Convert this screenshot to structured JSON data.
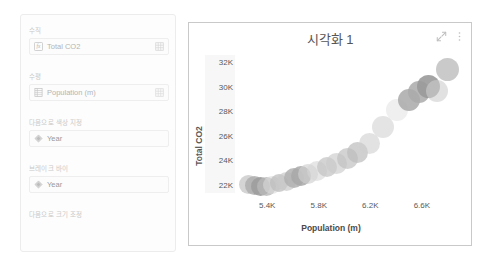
{
  "panel": {
    "wells": [
      {
        "label": "수직",
        "field": "Total CO2",
        "left_icon": "measure-fx-icon",
        "right_icon": "table-grid-icon",
        "has_right_icon": true
      },
      {
        "label": "수평",
        "field": "Population (m)",
        "left_icon": "column-table-icon",
        "right_icon": "table-grid-icon",
        "has_right_icon": true
      },
      {
        "label": "다음으로 색상 지정",
        "field": "Year",
        "left_icon": "diamond-icon",
        "right_icon": "",
        "has_right_icon": false
      },
      {
        "label": "브레이크 바이",
        "field": "Year",
        "left_icon": "diamond-icon",
        "right_icon": "",
        "has_right_icon": false
      },
      {
        "label": "다음으로 크기 조정",
        "field": "",
        "left_icon": "",
        "right_icon": "",
        "has_right_icon": false
      }
    ]
  },
  "chart_card": {
    "title": "시각화 1",
    "expand_icon": "focus-mode-expand-icon",
    "menu_icon": "more-options-vertical-dots-icon"
  },
  "chart_data": {
    "type": "scatter",
    "title": "시각화 1",
    "xlabel": "Population (m)",
    "ylabel": "Total CO2",
    "xlim": [
      5150,
      6950
    ],
    "ylim": [
      21000,
      32600
    ],
    "xticks": [
      "5.4K",
      "5.8K",
      "6.2K",
      "6.6K"
    ],
    "xtick_values": [
      5400,
      5800,
      6200,
      6600
    ],
    "yticks": [
      "22K",
      "24K",
      "26K",
      "28K",
      "30K",
      "32K"
    ],
    "ytick_values": [
      22000,
      24000,
      26000,
      28000,
      30000,
      32000
    ],
    "grid": false,
    "legend": "none",
    "color_by": "Year",
    "points": [
      {
        "x": 5255,
        "y": 22050,
        "r": 9.5,
        "shade": "#c6c6c6",
        "alpha": 0.75
      },
      {
        "x": 5300,
        "y": 21900,
        "r": 9.5,
        "shade": "#aeaeae",
        "alpha": 0.85
      },
      {
        "x": 5350,
        "y": 21820,
        "r": 9.5,
        "shade": "#9d9d9d",
        "alpha": 0.9
      },
      {
        "x": 5398,
        "y": 21860,
        "r": 9.5,
        "shade": "#b8b8b8",
        "alpha": 0.8
      },
      {
        "x": 5440,
        "y": 21980,
        "r": 9.0,
        "shade": "#d8d8d8",
        "alpha": 0.6
      },
      {
        "x": 5495,
        "y": 22180,
        "r": 9.0,
        "shade": "#bdbdbd",
        "alpha": 0.75
      },
      {
        "x": 5548,
        "y": 22260,
        "r": 9.5,
        "shade": "#c9c9c9",
        "alpha": 0.7
      },
      {
        "x": 5605,
        "y": 22520,
        "r": 10.0,
        "shade": "#b0b0b0",
        "alpha": 0.85
      },
      {
        "x": 5660,
        "y": 22700,
        "r": 10.0,
        "shade": "#a8a8a8",
        "alpha": 0.85
      },
      {
        "x": 5718,
        "y": 22900,
        "r": 10.0,
        "shade": "#cfcfcf",
        "alpha": 0.65
      },
      {
        "x": 5790,
        "y": 23150,
        "r": 10.0,
        "shade": "#d5d5d5",
        "alpha": 0.6
      },
      {
        "x": 5860,
        "y": 23450,
        "r": 10.0,
        "shade": "#c2c2c2",
        "alpha": 0.7
      },
      {
        "x": 5935,
        "y": 23700,
        "r": 10.5,
        "shade": "#cbcbcb",
        "alpha": 0.65
      },
      {
        "x": 6020,
        "y": 24150,
        "r": 10.5,
        "shade": "#c0c0c0",
        "alpha": 0.7
      },
      {
        "x": 6100,
        "y": 24600,
        "r": 10.5,
        "shade": "#bcbcbc",
        "alpha": 0.7
      },
      {
        "x": 6195,
        "y": 25400,
        "r": 10.5,
        "shade": "#cfcfcf",
        "alpha": 0.6
      },
      {
        "x": 6300,
        "y": 26700,
        "r": 11.0,
        "shade": "#d2d2d2",
        "alpha": 0.6
      },
      {
        "x": 6405,
        "y": 28100,
        "r": 11.0,
        "shade": "#e0e0e0",
        "alpha": 0.5
      },
      {
        "x": 6500,
        "y": 28950,
        "r": 11.0,
        "shade": "#a9a9a9",
        "alpha": 0.85
      },
      {
        "x": 6580,
        "y": 29600,
        "r": 11.0,
        "shade": "#aaaaaa",
        "alpha": 0.85
      },
      {
        "x": 6650,
        "y": 30050,
        "r": 11.5,
        "shade": "#9a9a9a",
        "alpha": 0.9
      },
      {
        "x": 6720,
        "y": 29700,
        "r": 11.0,
        "shade": "#cdcdcd",
        "alpha": 0.6
      },
      {
        "x": 6800,
        "y": 31450,
        "r": 11.5,
        "shade": "#bdbdbd",
        "alpha": 0.8
      }
    ]
  }
}
